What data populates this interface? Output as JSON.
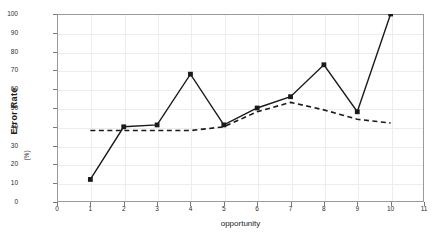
{
  "chart_data": {
    "type": "line",
    "title": "",
    "xlabel": "opportunity",
    "ylabel": "Error Rate",
    "yunit": "(%)",
    "xlim": [
      0,
      11
    ],
    "ylim": [
      0,
      100
    ],
    "xticks": [
      0,
      1,
      2,
      3,
      4,
      5,
      6,
      7,
      8,
      9,
      10,
      11
    ],
    "yticks": [
      0,
      10,
      20,
      30,
      40,
      50,
      60,
      70,
      80,
      90,
      100
    ],
    "grid": true,
    "legend": "none",
    "x": [
      1,
      2,
      3,
      4,
      5,
      6,
      7,
      8,
      9,
      10
    ],
    "series": [
      {
        "name": "Error Rate",
        "style": "solid",
        "marker": "square",
        "color": "#1a1a1a",
        "values": [
          12,
          40,
          41,
          68,
          41,
          50,
          56,
          73,
          48,
          100
        ]
      },
      {
        "name": "Trend",
        "style": "dashed",
        "marker": "none",
        "color": "#1a1a1a",
        "x": [
          1,
          2,
          3,
          4,
          5,
          6,
          7,
          8,
          9,
          10
        ],
        "values": [
          38,
          38,
          38,
          38,
          40,
          48,
          53,
          49,
          44,
          42
        ]
      }
    ]
  },
  "axes": {
    "y_label": "Error Rate",
    "y_unit": "(%)",
    "x_label": "opportunity"
  },
  "colors": {
    "line": "#1a1a1a",
    "grid": "#ededed",
    "frame": "#9a9a9a",
    "text": "#2b2b2b",
    "background": "#ffffff"
  }
}
